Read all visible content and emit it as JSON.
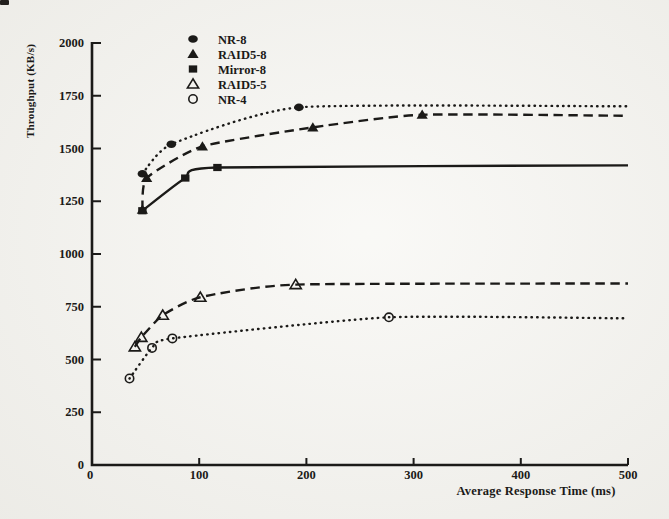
{
  "figure": {
    "background": "#f4f3ee",
    "ink": "#1b1a18",
    "scan_mark": "top-left-speck"
  },
  "chart_data": {
    "type": "line",
    "title": "",
    "xlabel": "Average Response Time (ms)",
    "ylabel": "Throughput (KB/s)",
    "xlim": [
      0,
      500
    ],
    "ylim": [
      0,
      2000
    ],
    "xticks": [
      0,
      100,
      200,
      300,
      400,
      500
    ],
    "yticks": [
      0,
      250,
      500,
      750,
      1000,
      1250,
      1500,
      1750,
      2000
    ],
    "grid": false,
    "legend": {
      "position": "top-left-inside",
      "entries": [
        "NR-8",
        "RAID5-8",
        "Mirror-8",
        "RAID5-5",
        "NR-4"
      ]
    },
    "series": [
      {
        "name": "NR-8",
        "marker": "filled-circle",
        "line_style": "dotted",
        "points": [
          [
            47,
            1380
          ],
          [
            74,
            1520
          ],
          [
            193,
            1695
          ]
        ],
        "asymptote": [
          500,
          1700
        ]
      },
      {
        "name": "RAID5-8",
        "marker": "filled-triangle",
        "line_style": "dashed",
        "points": [
          [
            47,
            1210
          ],
          [
            51,
            1360
          ],
          [
            103,
            1510
          ],
          [
            206,
            1600
          ],
          [
            308,
            1660
          ]
        ],
        "asymptote": [
          500,
          1655
        ]
      },
      {
        "name": "Mirror-8",
        "marker": "filled-square",
        "line_style": "solid",
        "points": [
          [
            47,
            1205
          ],
          [
            87,
            1360
          ],
          [
            117,
            1410
          ]
        ],
        "asymptote": [
          500,
          1420
        ]
      },
      {
        "name": "RAID5-5",
        "marker": "open-triangle",
        "line_style": "dashed",
        "points": [
          [
            40,
            560
          ],
          [
            46,
            605
          ],
          [
            66,
            710
          ],
          [
            101,
            795
          ],
          [
            190,
            855
          ]
        ],
        "asymptote": [
          500,
          860
        ]
      },
      {
        "name": "NR-4",
        "marker": "open-circle",
        "line_style": "dotted",
        "points": [
          [
            35,
            410
          ],
          [
            56,
            555
          ],
          [
            75,
            600
          ],
          [
            277,
            700
          ]
        ],
        "asymptote": [
          500,
          695
        ]
      }
    ]
  }
}
